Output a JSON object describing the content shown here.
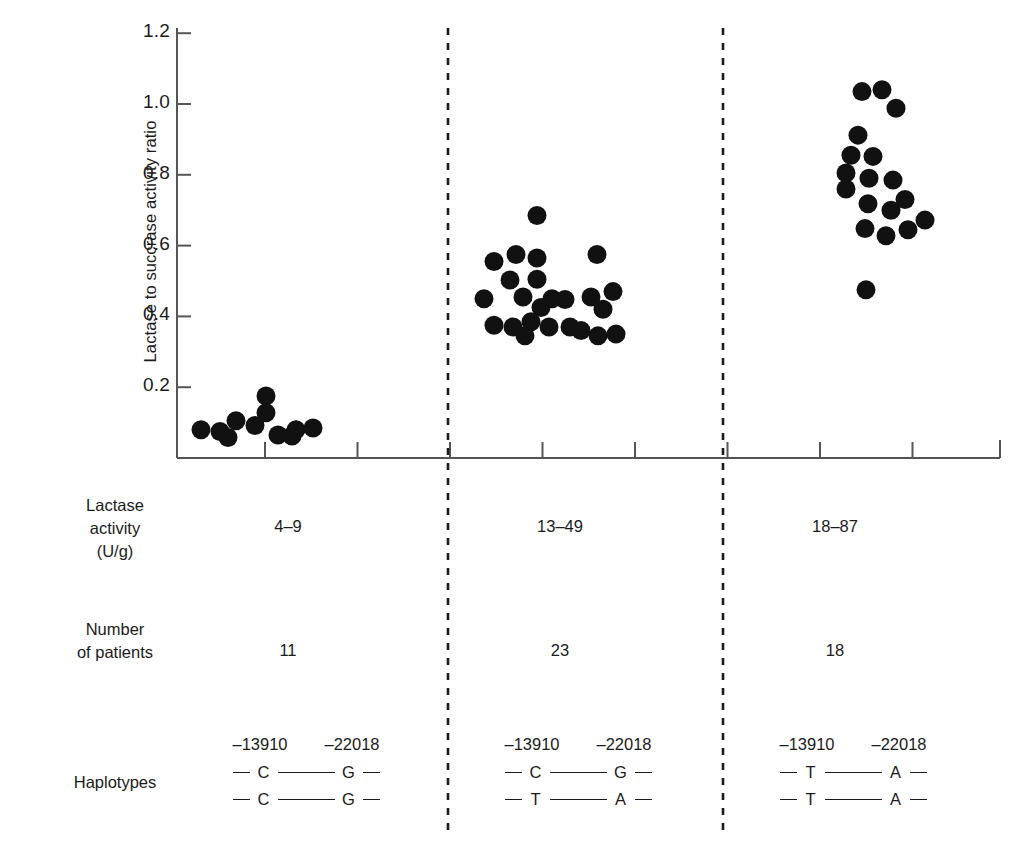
{
  "chart_data": {
    "type": "scatter",
    "title": "",
    "xlabel": "",
    "ylabel": "Lactase to succrase activity ratio",
    "ylim": [
      0,
      1.2
    ],
    "yticks": [
      0.2,
      0.4,
      0.6,
      0.8,
      1.0,
      1.2
    ],
    "ytick_labels": [
      "0.2",
      "0.4",
      "0.6",
      "0.8",
      "1.0",
      "1.2"
    ],
    "grid": false,
    "legend": "none",
    "groups": [
      {
        "name": "group-1",
        "lactase_activity": "4–9",
        "number_of_patients": "11",
        "haplotypes": [
          [
            "C",
            "G"
          ],
          [
            "C",
            "G"
          ]
        ],
        "values": [
          0.08,
          0.075,
          0.06,
          0.105,
          0.095,
          0.175,
          0.13,
          0.09,
          0.065,
          0.06,
          0.085
        ]
      },
      {
        "name": "group-2",
        "lactase_activity": "13–49",
        "number_of_patients": "23",
        "haplotypes": [
          [
            "C",
            "G"
          ],
          [
            "T",
            "A"
          ]
        ],
        "values": [
          0.555,
          0.575,
          0.685,
          0.545,
          0.505,
          0.47,
          0.46,
          0.445,
          0.425,
          0.44,
          0.575,
          0.47,
          0.455,
          0.4,
          0.37,
          0.385,
          0.36,
          0.345,
          0.34,
          0.375,
          0.35,
          0.365,
          0.355
        ]
      },
      {
        "name": "group-3",
        "lactase_activity": "18–87",
        "number_of_patients": "18",
        "haplotypes": [
          [
            "T",
            "A"
          ],
          [
            "T",
            "A"
          ]
        ],
        "values": [
          1.035,
          1.04,
          0.99,
          0.915,
          0.88,
          0.855,
          0.82,
          0.8,
          0.79,
          0.765,
          0.78,
          0.73,
          0.7,
          0.665,
          0.645,
          0.645,
          0.675,
          0.475
        ]
      }
    ],
    "points": [
      {
        "group": 1,
        "x": 201,
        "y": 0.08
      },
      {
        "group": 1,
        "x": 220,
        "y": 0.075
      },
      {
        "group": 1,
        "x": 228,
        "y": 0.058
      },
      {
        "group": 1,
        "x": 236,
        "y": 0.105
      },
      {
        "group": 1,
        "x": 255,
        "y": 0.092
      },
      {
        "group": 1,
        "x": 266,
        "y": 0.175
      },
      {
        "group": 1,
        "x": 266,
        "y": 0.128
      },
      {
        "group": 1,
        "x": 278,
        "y": 0.065
      },
      {
        "group": 1,
        "x": 292,
        "y": 0.062
      },
      {
        "group": 1,
        "x": 296,
        "y": 0.08
      },
      {
        "group": 1,
        "x": 313,
        "y": 0.085
      },
      {
        "group": 2,
        "x": 537,
        "y": 0.685
      },
      {
        "group": 2,
        "x": 494,
        "y": 0.555
      },
      {
        "group": 2,
        "x": 516,
        "y": 0.575
      },
      {
        "group": 2,
        "x": 537,
        "y": 0.565
      },
      {
        "group": 2,
        "x": 597,
        "y": 0.575
      },
      {
        "group": 2,
        "x": 510,
        "y": 0.503
      },
      {
        "group": 2,
        "x": 537,
        "y": 0.505
      },
      {
        "group": 2,
        "x": 484,
        "y": 0.45
      },
      {
        "group": 2,
        "x": 523,
        "y": 0.455
      },
      {
        "group": 2,
        "x": 552,
        "y": 0.45
      },
      {
        "group": 2,
        "x": 591,
        "y": 0.455
      },
      {
        "group": 2,
        "x": 613,
        "y": 0.47
      },
      {
        "group": 2,
        "x": 565,
        "y": 0.448
      },
      {
        "group": 2,
        "x": 541,
        "y": 0.425
      },
      {
        "group": 2,
        "x": 603,
        "y": 0.42
      },
      {
        "group": 2,
        "x": 494,
        "y": 0.375
      },
      {
        "group": 2,
        "x": 513,
        "y": 0.37
      },
      {
        "group": 2,
        "x": 531,
        "y": 0.385
      },
      {
        "group": 2,
        "x": 549,
        "y": 0.37
      },
      {
        "group": 2,
        "x": 570,
        "y": 0.37
      },
      {
        "group": 2,
        "x": 581,
        "y": 0.36
      },
      {
        "group": 2,
        "x": 525,
        "y": 0.345
      },
      {
        "group": 2,
        "x": 598,
        "y": 0.345
      },
      {
        "group": 2,
        "x": 616,
        "y": 0.35
      },
      {
        "group": 3,
        "x": 862,
        "y": 1.035
      },
      {
        "group": 3,
        "x": 882,
        "y": 1.04
      },
      {
        "group": 3,
        "x": 896,
        "y": 0.988
      },
      {
        "group": 3,
        "x": 858,
        "y": 0.912
      },
      {
        "group": 3,
        "x": 851,
        "y": 0.855
      },
      {
        "group": 3,
        "x": 873,
        "y": 0.852
      },
      {
        "group": 3,
        "x": 846,
        "y": 0.805
      },
      {
        "group": 3,
        "x": 869,
        "y": 0.79
      },
      {
        "group": 3,
        "x": 893,
        "y": 0.785
      },
      {
        "group": 3,
        "x": 846,
        "y": 0.76
      },
      {
        "group": 3,
        "x": 905,
        "y": 0.73
      },
      {
        "group": 3,
        "x": 868,
        "y": 0.718
      },
      {
        "group": 3,
        "x": 891,
        "y": 0.7
      },
      {
        "group": 3,
        "x": 925,
        "y": 0.672
      },
      {
        "group": 3,
        "x": 865,
        "y": 0.648
      },
      {
        "group": 3,
        "x": 886,
        "y": 0.628
      },
      {
        "group": 3,
        "x": 908,
        "y": 0.645
      },
      {
        "group": 3,
        "x": 866,
        "y": 0.475
      }
    ]
  },
  "axis": {
    "y_title": "Lactase to succrase activity ratio",
    "y_tick_labels": [
      "1.2",
      "1.0",
      "0.8",
      "0.6",
      "0.4",
      "0.2"
    ]
  },
  "table": {
    "rows": [
      {
        "id": "lactase-activity",
        "label_lines": [
          "Lactase",
          "activity",
          "(U/g)"
        ],
        "values": [
          "4–9",
          "13–49",
          "18–87"
        ]
      },
      {
        "id": "number-of-patients",
        "label_lines": [
          "Number",
          "of patients"
        ],
        "values": [
          "11",
          "23",
          "18"
        ]
      }
    ],
    "haplotypes_row": {
      "id": "haplotypes",
      "label": "Haplotypes",
      "headers": [
        "–13910",
        "–22018"
      ],
      "groups": [
        {
          "line1": [
            "C",
            "G"
          ],
          "line2": [
            "C",
            "G"
          ]
        },
        {
          "line1": [
            "C",
            "G"
          ],
          "line2": [
            "T",
            "A"
          ]
        },
        {
          "line1": [
            "T",
            "A"
          ],
          "line2": [
            "T",
            "A"
          ]
        }
      ]
    }
  },
  "colors": {
    "point": "#111111",
    "axis": "#555555",
    "divider": "#1b1b1b",
    "text": "#1b1b1b",
    "background": "#ffffff"
  }
}
